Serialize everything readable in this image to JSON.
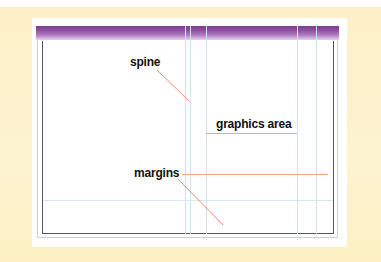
{
  "diagram": {
    "labels": {
      "spine": "spine",
      "graphics_area": "graphics area",
      "margins": "margins"
    },
    "colors": {
      "background": "#fdf3cf",
      "header_bar": "#8f4fa2",
      "leader_lines": "#f08a6c",
      "guides": "#cfe3ee",
      "page_frame": "#555555"
    },
    "guides": {
      "vertical_x": [
        185,
        190,
        206,
        297,
        316
      ],
      "horizontal_y": [
        200
      ]
    }
  }
}
